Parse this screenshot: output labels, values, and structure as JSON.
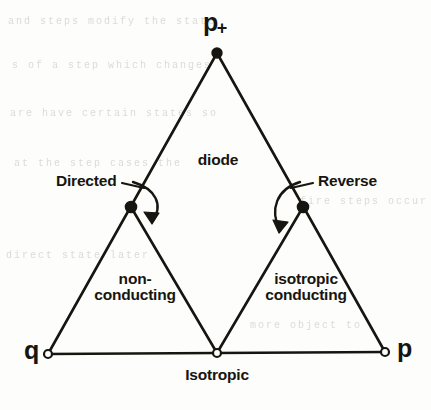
{
  "figure": {
    "kind": "triangular-phase-diagram",
    "ink_color": "#17150f",
    "paper_color": "#fdfdfc",
    "ghost_color": "#dbdbd6"
  },
  "vertices": {
    "apex": {
      "label_base": "p",
      "label_sub": "+",
      "x": 217,
      "y": 52,
      "marker": "filled-dot"
    },
    "left_mid": {
      "label": "Directed",
      "x": 131,
      "y": 207,
      "marker": "filled-dot"
    },
    "right_mid": {
      "label": "Reverse",
      "x": 303,
      "y": 207,
      "marker": "filled-dot"
    },
    "bottom_left": {
      "label": "q",
      "x": 48,
      "y": 354,
      "marker": "open-dot"
    },
    "bottom_center": {
      "label": "Isotropic",
      "x": 217,
      "y": 353,
      "marker": "open-dot"
    },
    "bottom_right": {
      "label": "p",
      "x": 385,
      "y": 352,
      "marker": "open-dot"
    }
  },
  "regions": {
    "top": {
      "label": "diode"
    },
    "left": {
      "line1": "non-",
      "line2": "conducting"
    },
    "right": {
      "line1": "isotropic",
      "line2": "conducting"
    }
  },
  "callouts": {
    "left": {
      "text": "Directed"
    },
    "right": {
      "text": "Reverse"
    }
  },
  "axis_labels": {
    "left": "q",
    "right": "p",
    "center": "Isotropic"
  },
  "ghost_text": {
    "lines": [
      "and steps modify the state",
      "s of a step which changes",
      "are have certain states so",
      "at the step cases the",
      "fire steps occur",
      "direct state later",
      "more object to"
    ]
  }
}
